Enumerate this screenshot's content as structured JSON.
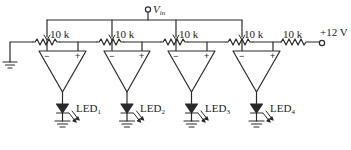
{
  "diagram": {
    "type": "circuit-schematic",
    "colors": {
      "wire": "#2a2a2a",
      "background": "#ffffff"
    },
    "input": {
      "label": "V",
      "subscript": "in",
      "terminal": "open-circle"
    },
    "supply": {
      "label": "+12 V",
      "terminal": "open-circle"
    },
    "resistors": [
      {
        "id": "R1",
        "label": "10 k",
        "type": "potentiometer"
      },
      {
        "id": "R2",
        "label": "10 k",
        "type": "potentiometer"
      },
      {
        "id": "R3",
        "label": "10 k",
        "type": "potentiometer"
      },
      {
        "id": "R4",
        "label": "10 k",
        "type": "potentiometer"
      },
      {
        "id": "R5",
        "label": "10 k",
        "type": "fixed"
      }
    ],
    "comparators": [
      {
        "id": "U1",
        "inv_label": "−",
        "noninv_label": "+",
        "led": {
          "label": "LED",
          "subscript": "1"
        }
      },
      {
        "id": "U2",
        "inv_label": "−",
        "noninv_label": "+",
        "led": {
          "label": "LED",
          "subscript": "2"
        }
      },
      {
        "id": "U3",
        "inv_label": "−",
        "noninv_label": "+",
        "led": {
          "label": "LED",
          "subscript": "3"
        }
      },
      {
        "id": "U4",
        "inv_label": "−",
        "noninv_label": "+",
        "led": {
          "label": "LED",
          "subscript": "4"
        }
      }
    ],
    "ground_symbols": 5
  }
}
